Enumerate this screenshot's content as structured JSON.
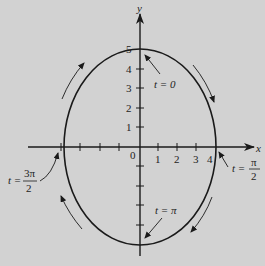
{
  "diagram": {
    "axes": {
      "x_label": "x",
      "y_label": "y",
      "origin_label": "0"
    },
    "x_ticks": [
      "1",
      "2",
      "3",
      "4"
    ],
    "y_ticks": [
      "1",
      "2",
      "3",
      "4",
      "5"
    ],
    "annotations": {
      "t0": "t = 0",
      "t_pi2_lhs": "t =",
      "t_pi2_num": "π",
      "t_pi2_den": "2",
      "t_pi": "t = π",
      "t_3pi2_lhs": "t =",
      "t_3pi2_num": "3π",
      "t_3pi2_den": "2"
    },
    "curve": {
      "semi_axis_x": 4,
      "semi_axis_y": 5,
      "direction": "clockwise"
    },
    "colors": {
      "background": "#d2d2d2",
      "stroke": "#1a1a1a"
    }
  }
}
